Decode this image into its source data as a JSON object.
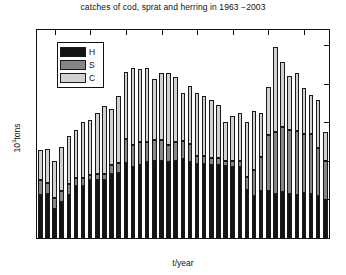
{
  "chart_data": {
    "type": "bar",
    "subtype": "stacked",
    "title": "catches of cod, sprat and herring in 1963 −2003",
    "xlabel": "t/year",
    "ylabel": "10³tons",
    "ylim": [
      0,
      1080
    ],
    "yticks": [
      0,
      200,
      400,
      600,
      800,
      1000
    ],
    "ytick_labels": [
      "0",
      "200",
      "400",
      "600",
      "800",
      "1000"
    ],
    "xticks": [
      1965,
      1970,
      1975,
      1980,
      1985,
      1990,
      1995,
      2000
    ],
    "xtick_labels": [
      "1965",
      "1970",
      "1975",
      "1980",
      "1985",
      "1990",
      "1995",
      "2000"
    ],
    "grid": false,
    "legend_position": "upper left",
    "legend": [
      {
        "key": "H",
        "label": "H",
        "color": "#141414"
      },
      {
        "key": "S",
        "label": "S",
        "color": "#868686"
      },
      {
        "key": "C",
        "label": "C",
        "color": "#d2d2d2"
      }
    ],
    "categories": [
      1963,
      1964,
      1965,
      1966,
      1967,
      1968,
      1969,
      1970,
      1971,
      1972,
      1973,
      1974,
      1975,
      1976,
      1977,
      1978,
      1979,
      1980,
      1981,
      1982,
      1983,
      1984,
      1985,
      1986,
      1987,
      1988,
      1989,
      1990,
      1991,
      1992,
      1993,
      1994,
      1995,
      1996,
      1997,
      1998,
      1999,
      2000,
      2001,
      2002,
      2003
    ],
    "series": [
      {
        "name": "H",
        "label": "H",
        "color": "#141414",
        "values": [
          225,
          230,
          150,
          185,
          225,
          270,
          270,
          300,
          300,
          300,
          330,
          340,
          390,
          370,
          380,
          395,
          400,
          400,
          395,
          400,
          410,
          395,
          385,
          385,
          380,
          380,
          375,
          370,
          370,
          250,
          220,
          245,
          245,
          230,
          240,
          230,
          225,
          235,
          230,
          220,
          195
        ]
      },
      {
        "name": "S",
        "label": "S",
        "color": "#868686",
        "values": [
          75,
          55,
          60,
          60,
          55,
          40,
          40,
          25,
          35,
          35,
          50,
          50,
          125,
          115,
          120,
          105,
          110,
          110,
          90,
          100,
          95,
          95,
          40,
          40,
          35,
          35,
          25,
          30,
          30,
          65,
          135,
          175,
          290,
          320,
          335,
          330,
          330,
          305,
          310,
          250,
          205
        ]
      },
      {
        "name": "C",
        "label": "C",
        "color": "#d2d2d2",
        "values": [
          155,
          175,
          190,
          230,
          250,
          250,
          290,
          290,
          315,
          350,
          290,
          350,
          345,
          400,
          375,
          385,
          315,
          345,
          370,
          335,
          250,
          300,
          330,
          310,
          300,
          275,
          200,
          235,
          250,
          285,
          305,
          230,
          250,
          440,
          340,
          280,
          300,
          240,
          205,
          245,
          150
        ]
      }
    ],
    "totals": [
      455,
      460,
      400,
      475,
      530,
      560,
      600,
      615,
      650,
      685,
      670,
      740,
      860,
      885,
      875,
      885,
      825,
      855,
      855,
      835,
      755,
      790,
      755,
      735,
      715,
      690,
      600,
      635,
      650,
      600,
      660,
      650,
      785,
      990,
      915,
      840,
      855,
      780,
      745,
      715,
      550
    ]
  }
}
